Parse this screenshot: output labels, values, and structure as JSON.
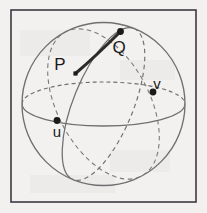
{
  "figure": {
    "background_color": "#f2f1ef",
    "frame": {
      "name": "figure-border",
      "x": 11,
      "y": 10,
      "width": 185,
      "height": 192,
      "stroke_color": "#3a3a42",
      "stroke_width": 1.6
    },
    "sphere": {
      "name": "sphere-outline",
      "center_x": 103.5,
      "center_y": 104,
      "radius": 81.5,
      "stroke_color": "#6f6f72",
      "stroke_width": 1.2
    },
    "equator": {
      "name": "equator-ellipse",
      "center_x": 103.5,
      "center_y": 104,
      "rx": 81.5,
      "ry": 22,
      "front_style": "solid",
      "back_style": "dashed",
      "stroke_color": "#6f6f72",
      "stroke_width": 1.2,
      "dash_pattern": "4 3"
    },
    "great_circles": [
      {
        "name": "great-circle-u",
        "through_point": "u",
        "center_x": 103.5,
        "center_y": 104,
        "rx": 30,
        "ry": 81.5,
        "rotation_deg": 22,
        "front_style": "solid",
        "back_style": "dashed",
        "stroke_color": "#6f6f72",
        "stroke_width": 1.2
      },
      {
        "name": "great-circle-v",
        "through_point": "v",
        "center_x": 103.5,
        "center_y": 104,
        "rx": 46,
        "ry": 81.5,
        "rotation_deg": -28,
        "front_style": "dashed",
        "back_style": "dashed",
        "stroke_color": "#7a7a7d",
        "stroke_width": 1.1
      }
    ],
    "geodesic_arc": {
      "name": "geodesic-arc-pq",
      "from": "P",
      "to": "Q",
      "stroke_color": "#2b2b2b",
      "stroke_width": 3.1,
      "style": "solid",
      "path": "M 75.5 73.5 Q 96 56 120.5 31.5"
    },
    "points": [
      {
        "name": "point-p",
        "label": "P",
        "x": 75.5,
        "y": 73.5,
        "label_x": 60,
        "label_y": 70,
        "marker": "square-dot",
        "marker_size": 4.2,
        "label_size": "major",
        "color": "#1a1a1a"
      },
      {
        "name": "point-q",
        "label": "Q",
        "x": 120.5,
        "y": 31.5,
        "label_x": 119,
        "label_y": 53,
        "marker": "round-dot",
        "marker_size": 3.4,
        "label_size": "major",
        "color": "#1a1a1a"
      },
      {
        "name": "point-u",
        "label": "u",
        "x": 57,
        "y": 120.5,
        "label_x": 57,
        "label_y": 137,
        "marker": "round-dot",
        "marker_size": 3.4,
        "label_size": "minor",
        "color": "#1a1a1a"
      },
      {
        "name": "point-v",
        "label": "v",
        "x": 153,
        "y": 92,
        "label_x": 157,
        "label_y": 89,
        "marker": "round-dot",
        "marker_size": 3.4,
        "label_size": "minor",
        "color": "#1a1a1a"
      }
    ]
  },
  "chart_data": {
    "type": "diagram",
    "labels": [
      "P",
      "Q",
      "u",
      "v"
    ],
    "annotations": [
      {
        "label": "P",
        "x": 75.5,
        "y": 73.5,
        "role": "geodesic-start"
      },
      {
        "label": "Q",
        "x": 120.5,
        "y": 31.5,
        "role": "geodesic-end"
      },
      {
        "label": "u",
        "x": 57,
        "y": 120.5,
        "role": "tangent-basis-vector"
      },
      {
        "label": "v",
        "x": 153,
        "y": 92,
        "role": "tangent-basis-vector"
      }
    ],
    "grid": false,
    "legend": "none"
  }
}
